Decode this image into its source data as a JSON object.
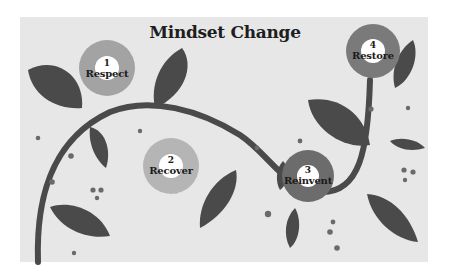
{
  "title": "Mindset Change",
  "colors": {
    "page_background": "#ffffff",
    "card_background": "#e7e7e7",
    "stem": "#4a4a4a",
    "leaf": "#4a4a4a",
    "dot": "#6a6a6a",
    "center_fill": "#ffffff",
    "text": "#1a1a1a"
  },
  "steps": [
    {
      "number": "1",
      "label": "Respect",
      "ring_color": "#a3a3a3"
    },
    {
      "number": "2",
      "label": "Recover",
      "ring_color": "#b5b5b5"
    },
    {
      "number": "3",
      "label": "Reinvent",
      "ring_color": "#6c6c6c"
    },
    {
      "number": "4",
      "label": "Restore",
      "ring_color": "#7a7a7a"
    }
  ]
}
